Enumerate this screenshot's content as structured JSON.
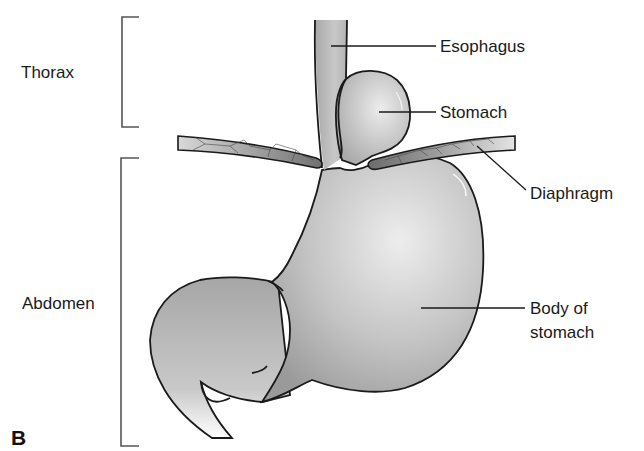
{
  "figure": {
    "panel_label": "B",
    "regions": [
      {
        "label": "Thorax"
      },
      {
        "label": "Abdomen"
      }
    ],
    "structures": [
      {
        "label": "Esophagus"
      },
      {
        "label": "Stomach"
      },
      {
        "label": "Diaphragm"
      },
      {
        "label_line1": "Body of",
        "label_line2": "stomach"
      }
    ],
    "colors": {
      "organ_fill_dark": "#9c9c9c",
      "organ_fill_light": "#e6e6e6",
      "diaphragm_fill": "#8a8a8a",
      "outline": "#1a1a1a",
      "bracket": "#555555"
    }
  }
}
